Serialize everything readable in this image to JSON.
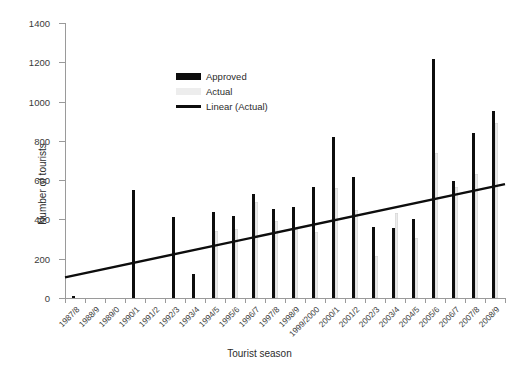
{
  "chart_data": {
    "type": "bar",
    "title": "",
    "xlabel": "Tourist season",
    "ylabel": "Number of tourists",
    "ylim": [
      0,
      1400
    ],
    "ytick_step": 200,
    "yticks": [
      0,
      200,
      400,
      600,
      800,
      1000,
      1200,
      1400
    ],
    "grid": false,
    "legend_position": "upper-center-left",
    "categories": [
      "1987/8",
      "1988/9",
      "1989/0",
      "1990/1",
      "1991/2",
      "1992/3",
      "1993/4",
      "1994/5",
      "1995/6",
      "1996/7",
      "1997/8",
      "1998/9",
      "1999/2000",
      "2000/1",
      "2001/2",
      "2002/3",
      "2003/4",
      "2004/5",
      "2005/6",
      "2006/7",
      "2007/8",
      "2008/9"
    ],
    "series": [
      {
        "name": "Approved",
        "color": "#0d0d0d",
        "values": [
          10,
          0,
          0,
          550,
          0,
          410,
          120,
          440,
          420,
          530,
          455,
          465,
          565,
          820,
          615,
          360,
          355,
          400,
          1215,
          595,
          840,
          950
        ]
      },
      {
        "name": "Actual",
        "color": "#ededed",
        "values": [
          0,
          0,
          0,
          0,
          0,
          0,
          0,
          340,
          350,
          490,
          390,
          350,
          335,
          560,
          450,
          215,
          435,
          305,
          740,
          565,
          630,
          890
        ]
      }
    ],
    "trend": {
      "name": "Linear (Actual)",
      "color": "#0d0d0d",
      "start_value": 105,
      "end_value": 580
    }
  },
  "legend": {
    "items": [
      {
        "label": "Approved",
        "icon": "black-bar-swatch"
      },
      {
        "label": "Actual",
        "icon": "light-gray-bar-swatch"
      },
      {
        "label": "Linear (Actual)",
        "icon": "black-line-swatch"
      }
    ]
  }
}
